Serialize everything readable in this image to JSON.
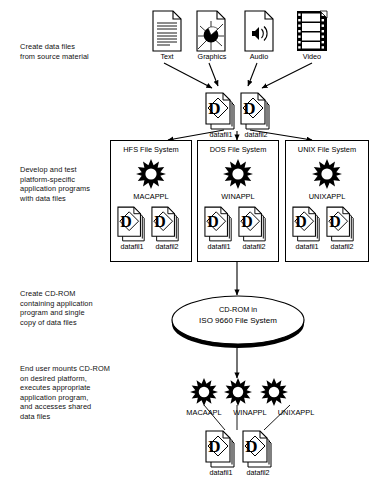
{
  "diagram": {
    "background_color": "#ffffff",
    "ink_color": "#000000",
    "width": 383,
    "height": 502
  },
  "steps": [
    {
      "id": "step-1",
      "caption": "Create data files\nfrom source material"
    },
    {
      "id": "step-2",
      "caption": "Develop and test\nplatform-specific\napplication programs\nwith data files"
    },
    {
      "id": "step-3",
      "caption": "Create CD-ROM\ncontaining application\nprogram and single\ncopy of data files"
    },
    {
      "id": "step-4",
      "caption": "End user mounts CD-ROM\non desired platform,\nexecutes appropriate\napplication program,\nand accesses shared\ndata files"
    }
  ],
  "source_files": [
    {
      "label": "Text",
      "icon": "text-document-icon"
    },
    {
      "label": "Graphics",
      "icon": "graphics-document-icon"
    },
    {
      "label": "Audio",
      "icon": "audio-document-icon"
    },
    {
      "label": "Video",
      "icon": "video-filmstrip-icon"
    }
  ],
  "top_data_files": [
    {
      "label": "datafil1",
      "icon": "data-document-icon"
    },
    {
      "label": "datafil2",
      "icon": "data-document-icon"
    }
  ],
  "platforms": [
    {
      "id": "hfs",
      "title": "HFS File System",
      "app_icon": "starburst-application-icon",
      "app_name": "MACAPPL",
      "data_files": [
        {
          "label": "datafil1",
          "icon": "data-document-icon"
        },
        {
          "label": "datafil2",
          "icon": "data-document-icon"
        }
      ]
    },
    {
      "id": "dos",
      "title": "DOS File System",
      "app_icon": "starburst-application-icon",
      "app_name": "WINAPPL",
      "data_files": [
        {
          "label": "datafil1",
          "icon": "data-document-icon"
        },
        {
          "label": "datafil2",
          "icon": "data-document-icon"
        }
      ]
    },
    {
      "id": "unix",
      "title": "UNIX File System",
      "app_icon": "starburst-application-icon",
      "app_name": "UNIXAPPL",
      "data_files": [
        {
          "label": "datafil1",
          "icon": "data-document-icon"
        },
        {
          "label": "datafil2",
          "icon": "data-document-icon"
        }
      ]
    }
  ],
  "cdrom": {
    "line1": "CD-ROM in",
    "line2": "ISO 9660 File System",
    "shape": "ellipse"
  },
  "end_user": {
    "apps": [
      {
        "name": "MACAAPL",
        "icon": "starburst-application-icon"
      },
      {
        "name": "WINAPPL",
        "icon": "starburst-application-icon"
      },
      {
        "name": "UNIXAPPL",
        "icon": "starburst-application-icon"
      }
    ],
    "shared_data_files": [
      {
        "label": "datafil1",
        "icon": "data-document-icon"
      },
      {
        "label": "datafil2",
        "icon": "data-document-icon"
      }
    ]
  }
}
